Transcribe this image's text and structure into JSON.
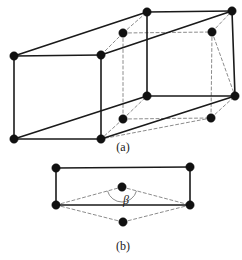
{
  "figure": {
    "title_absent": true,
    "captions": [
      {
        "id": "caption-a",
        "text": "(a)",
        "x": 123,
        "y": 151
      },
      {
        "id": "caption-b",
        "text": "(b)",
        "x": 123,
        "y": 250
      }
    ],
    "angle_labels": [
      {
        "id": "beta",
        "text": "β",
        "x": 126,
        "y": 204
      }
    ],
    "colors": {
      "line_solid": "#1a1a1a",
      "line_dashed": "#8c8c8c",
      "node_fill": "#111111",
      "background": "#ffffff"
    },
    "style": {
      "solid_stroke_width": 1.6,
      "dashed_stroke_width": 1.0,
      "dash_pattern": "3,2.5",
      "node_radius": 4.2
    },
    "panel_a": {
      "name": "monoclinic-unit-cell-3d",
      "nodes": [
        {
          "id": "a-front-top-left",
          "x": 14,
          "y": 56,
          "style": "solid"
        },
        {
          "id": "a-front-top-mid",
          "x": 101,
          "y": 55,
          "style": "solid"
        },
        {
          "id": "a-back-top-mid",
          "x": 147,
          "y": 12,
          "style": "solid"
        },
        {
          "id": "a-back-top-right",
          "x": 232,
          "y": 11,
          "style": "solid"
        },
        {
          "id": "a-inner-top-left",
          "x": 123,
          "y": 33,
          "style": "dashed"
        },
        {
          "id": "a-inner-top-right",
          "x": 212,
          "y": 32,
          "style": "dashed"
        },
        {
          "id": "a-front-bot-left",
          "x": 14,
          "y": 139,
          "style": "solid"
        },
        {
          "id": "a-front-bot-mid",
          "x": 101,
          "y": 139,
          "style": "solid"
        },
        {
          "id": "a-mid-bot-left",
          "x": 147,
          "y": 96,
          "style": "solid"
        },
        {
          "id": "a-mid-bot-right",
          "x": 235,
          "y": 96,
          "style": "solid"
        },
        {
          "id": "a-inner-bot-left",
          "x": 123,
          "y": 119,
          "style": "dashed"
        },
        {
          "id": "a-inner-bot-right",
          "x": 211,
          "y": 118,
          "style": "dashed"
        }
      ],
      "solid_edges": [
        [
          "a-front-top-left",
          "a-front-top-mid"
        ],
        [
          "a-front-top-left",
          "a-back-top-mid"
        ],
        [
          "a-back-top-mid",
          "a-back-top-right"
        ],
        [
          "a-front-top-mid",
          "a-back-top-right"
        ],
        [
          "a-front-top-left",
          "a-front-bot-left"
        ],
        [
          "a-front-top-mid",
          "a-front-bot-mid"
        ],
        [
          "a-back-top-mid",
          "a-mid-bot-left"
        ],
        [
          "a-back-top-right",
          "a-mid-bot-right"
        ],
        [
          "a-front-bot-left",
          "a-front-bot-mid"
        ],
        [
          "a-front-bot-left",
          "a-mid-bot-left"
        ],
        [
          "a-mid-bot-left",
          "a-mid-bot-right"
        ],
        [
          "a-front-bot-mid",
          "a-mid-bot-right"
        ]
      ],
      "dashed_edges": [
        [
          "a-inner-top-left",
          "a-inner-top-right"
        ],
        [
          "a-inner-top-left",
          "a-front-top-mid"
        ],
        [
          "a-inner-top-left",
          "a-back-top-mid"
        ],
        [
          "a-inner-top-right",
          "a-back-top-right"
        ],
        [
          "a-inner-top-left",
          "a-inner-bot-left"
        ],
        [
          "a-inner-top-right",
          "a-inner-bot-right"
        ],
        [
          "a-inner-bot-left",
          "a-inner-bot-right"
        ],
        [
          "a-inner-bot-left",
          "a-front-bot-mid"
        ],
        [
          "a-inner-bot-left",
          "a-mid-bot-left"
        ],
        [
          "a-inner-bot-right",
          "a-mid-bot-right"
        ],
        [
          "a-inner-bot-right",
          "a-front-bot-mid"
        ],
        [
          "a-inner-top-right",
          "a-mid-bot-right"
        ]
      ]
    },
    "panel_b": {
      "name": "monoclinic-unit-cell-projection",
      "nodes": [
        {
          "id": "b-top-left",
          "x": 56,
          "y": 168,
          "style": "solid"
        },
        {
          "id": "b-top-right",
          "x": 190,
          "y": 167,
          "style": "solid"
        },
        {
          "id": "b-bot-left",
          "x": 56,
          "y": 205,
          "style": "solid"
        },
        {
          "id": "b-bot-right",
          "x": 190,
          "y": 205,
          "style": "solid"
        },
        {
          "id": "b-center-upper",
          "x": 122,
          "y": 187,
          "style": "dashed"
        },
        {
          "id": "b-center-lower",
          "x": 123,
          "y": 222,
          "style": "dashed"
        }
      ],
      "solid_edges": [
        [
          "b-top-left",
          "b-top-right"
        ],
        [
          "b-top-left",
          "b-bot-left"
        ],
        [
          "b-top-right",
          "b-bot-right"
        ],
        [
          "b-bot-left",
          "b-bot-right"
        ]
      ],
      "dashed_edges": [
        [
          "b-bot-left",
          "b-center-upper"
        ],
        [
          "b-center-upper",
          "b-bot-right"
        ],
        [
          "b-bot-left",
          "b-center-lower"
        ],
        [
          "b-center-lower",
          "b-bot-right"
        ]
      ],
      "angle_arc": {
        "center": {
          "x": 122,
          "y": 187
        },
        "radius": 15,
        "start_deg": 165,
        "end_deg": 15
      }
    }
  }
}
